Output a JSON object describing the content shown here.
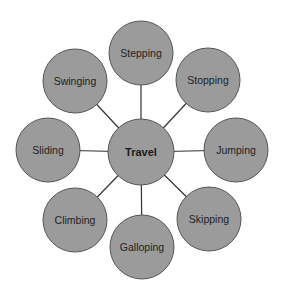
{
  "diagram": {
    "type": "spider-map",
    "center": {
      "label": "Travel"
    },
    "branches": [
      {
        "label": "Stepping",
        "direction": "top"
      },
      {
        "label": "Stopping",
        "direction": "top-right"
      },
      {
        "label": "Jumping",
        "direction": "right"
      },
      {
        "label": "Skipping",
        "direction": "bottom-right"
      },
      {
        "label": "Galloping",
        "direction": "bottom"
      },
      {
        "label": "Climbing",
        "direction": "bottom-left"
      },
      {
        "label": "Sliding",
        "direction": "left"
      },
      {
        "label": "Swinging",
        "direction": "top-left"
      }
    ],
    "colors": {
      "node_fill": "#9b9b9b",
      "node_stroke": "#555555",
      "connector": "#333333",
      "text": "#222222"
    }
  }
}
